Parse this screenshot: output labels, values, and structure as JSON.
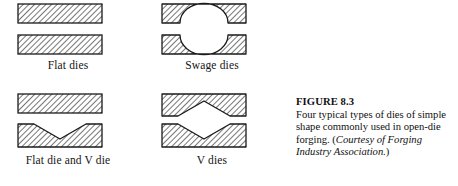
{
  "figure": {
    "title": "FIGURE 8.3",
    "caption_text": "Four typical types of dies of simple shape commonly used in open-die forging. (",
    "caption_credit": "Courtesy of Forging Industry Association.",
    "caption_close": ")"
  },
  "panels": [
    {
      "id": "flat-dies",
      "label": "Flat dies",
      "upper_die": "flat rectangular block",
      "lower_die": "flat rectangular block"
    },
    {
      "id": "swage-dies",
      "label": "Swage dies",
      "upper_die": "block with semicircular concave cavity on lower face",
      "lower_die": "block with semicircular concave cavity on upper face"
    },
    {
      "id": "flat-die-and-v-die",
      "label": "Flat die and V die",
      "upper_die": "flat rectangular block",
      "lower_die": "block with V-shaped notch on upper face"
    },
    {
      "id": "v-dies",
      "label": "V dies",
      "upper_die": "block with V-shaped notch on lower face",
      "lower_die": "block with V-shaped notch on upper face"
    }
  ],
  "style": {
    "hatch_color": "#4a4a4a",
    "outline_color": "#1a1a1a",
    "fill_color": "#ffffff",
    "background": "#ffffff"
  }
}
